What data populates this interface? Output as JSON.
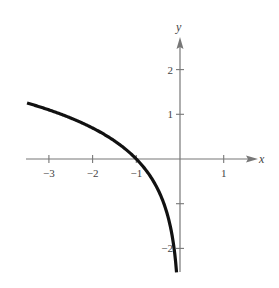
{
  "chart_data": {
    "type": "line",
    "title": "",
    "xlabel": "x",
    "ylabel": "y",
    "xlim": [
      -3.5,
      1.5
    ],
    "ylim": [
      -2.6,
      2.6
    ],
    "grid": false,
    "legend": null,
    "x_ticks": [
      -3,
      -2,
      -1,
      1
    ],
    "x_tick_labels": [
      "-3",
      "-2",
      "-1",
      "1"
    ],
    "y_ticks": [
      2,
      1,
      -1,
      -2
    ],
    "y_tick_labels": [
      "2",
      "1",
      "",
      "-2"
    ],
    "series": [
      {
        "name": "f(x) = ln(-x)",
        "color": "#111111",
        "x": [
          -3.5,
          -3,
          -2.5,
          -2,
          -1.5,
          -1,
          -0.75,
          -0.5,
          -0.3,
          -0.2,
          -0.12,
          -0.08
        ],
        "y": [
          1.25,
          1.1,
          0.92,
          0.69,
          0.41,
          0.0,
          -0.29,
          -0.69,
          -1.2,
          -1.61,
          -2.12,
          -2.53
        ]
      }
    ]
  },
  "colors": {
    "axis": "#777777",
    "curve": "#111111",
    "text": "#444444"
  }
}
